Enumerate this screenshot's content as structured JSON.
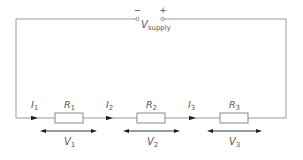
{
  "supply": {
    "minus": "−",
    "plus": "+",
    "label_main": "V",
    "label_sub": "supply"
  },
  "currents": [
    {
      "main": "I",
      "sub": "1"
    },
    {
      "main": "I",
      "sub": "2"
    },
    {
      "main": "I",
      "sub": "3"
    }
  ],
  "resistors": [
    {
      "main": "R",
      "sub": "1"
    },
    {
      "main": "R",
      "sub": "2"
    },
    {
      "main": "R",
      "sub": "3"
    }
  ],
  "voltages": [
    {
      "main": "V",
      "sub": "1"
    },
    {
      "main": "V",
      "sub": "2"
    },
    {
      "main": "V",
      "sub": "3"
    }
  ],
  "colors": {
    "wire": "#9a9a9a",
    "text": "#555555",
    "arrow": "#222222"
  }
}
